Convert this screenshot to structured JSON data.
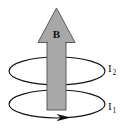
{
  "figure": {
    "type": "physics-diagram",
    "background_color": "#ffffff",
    "labels": {
      "field_vector": "B",
      "current_upper": "I",
      "current_upper_subscript": "2",
      "current_lower": "I",
      "current_lower_subscript": "1"
    },
    "colors": {
      "arrow_fill": "#a8a8a8",
      "arrow_outline": "#5a5a5a",
      "loop_stroke": "#111111",
      "text": "#111111"
    },
    "elements": {
      "field_arrow_name": "magnetic-field-arrow",
      "upper_loop_name": "current-loop-upper",
      "lower_loop_name": "current-loop-lower",
      "current_direction_arrowhead_name": "current-direction-arrowhead"
    },
    "geometry": {
      "arrow_shaft_left": 47,
      "arrow_shaft_right": 66,
      "arrow_shaft_top": 40,
      "arrow_shaft_bottom": 110,
      "arrow_head_left": 38,
      "arrow_head_right": 75,
      "arrow_head_apex_y": 8,
      "arrow_head_base_y": 42,
      "loop_center_x": 57,
      "loop_rx": 48,
      "loop_ry": 14,
      "upper_loop_cy": 71,
      "lower_loop_cy": 104
    }
  }
}
